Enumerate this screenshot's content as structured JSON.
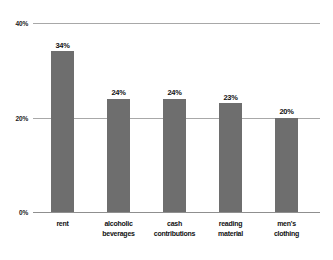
{
  "chart_data": {
    "type": "bar",
    "title": "",
    "subtitle": "",
    "xlabel": "",
    "ylabel": "",
    "categories": [
      "rent",
      "alcoholic beverages",
      "cash contributions",
      "reading material",
      "men's clothing"
    ],
    "category_lines": [
      [
        "rent"
      ],
      [
        "alcoholic",
        "beverages"
      ],
      [
        "cash",
        "contributions"
      ],
      [
        "reading",
        "material"
      ],
      [
        "men's",
        "clothing"
      ]
    ],
    "values": [
      34,
      24,
      24,
      23,
      20
    ],
    "value_labels": [
      "34%",
      "24%",
      "24%",
      "23%",
      "20%"
    ],
    "ylim": [
      0,
      40
    ],
    "yticks": [
      0,
      20,
      40
    ],
    "ytick_labels": [
      "0%",
      "20%",
      "40%"
    ],
    "grid": true,
    "legend": null,
    "legend_position": "none",
    "colors": {
      "bar_fill": "#6e6e6e",
      "gridline": "#a8a8a8",
      "baseline": "#8f8f8f",
      "text": "#111111",
      "background": "#ffffff"
    }
  }
}
